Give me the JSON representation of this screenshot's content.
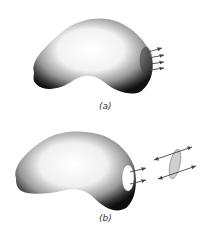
{
  "figure": {
    "panels": [
      {
        "id": "a",
        "label": "(a)",
        "description": "Kidney-shaped body with a shaded surface patch at its right end; four parallel arrows point outward from the patch"
      },
      {
        "id": "b",
        "label": "(b)",
        "description": "Kidney-shaped body with a white (removed) patch at its right end; two arrows point outward; a separate gray elliptical patch is shown detached with two double-headed arrows through it"
      }
    ],
    "colors": {
      "body_dark": "#1a1a1a",
      "body_light": "#ffffff",
      "patch_gray": "#cfcfcf",
      "arrow": "#444444"
    }
  }
}
